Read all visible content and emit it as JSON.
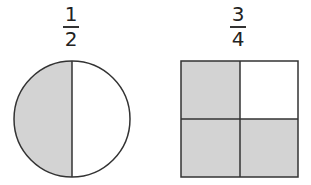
{
  "figures": [
    {
      "shape": "circle",
      "fraction": {
        "numerator": "1",
        "denominator": "2"
      },
      "parts": 2,
      "shaded_parts": 1
    },
    {
      "shape": "square",
      "fraction": {
        "numerator": "3",
        "denominator": "4"
      },
      "parts": 4,
      "shaded_parts": 3
    }
  ],
  "colors": {
    "shade": "#d3d3d3",
    "stroke": "#333333",
    "background": "#ffffff"
  }
}
